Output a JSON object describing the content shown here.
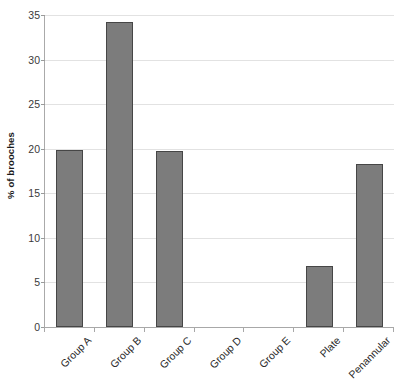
{
  "chart_data": {
    "type": "bar",
    "title": "",
    "subtitle": "",
    "xlabel": "",
    "ylabel": "% of brooches",
    "categories": [
      "Group A",
      "Group B",
      "Group C",
      "Group D",
      "Group E",
      "Plate",
      "Penannular"
    ],
    "values": [
      19.9,
      34.2,
      19.8,
      0,
      0,
      6.9,
      18.3
    ],
    "ylim": [
      0,
      35
    ],
    "ytick_labels": [
      "0",
      "5",
      "10",
      "15",
      "20",
      "25",
      "30",
      "35"
    ],
    "ytick_values": [
      0,
      5,
      10,
      15,
      20,
      25,
      30,
      35
    ],
    "grid": true,
    "grid_axis": "y",
    "legend": false,
    "legend_position": "none",
    "series": [
      {
        "name": "% of brooches",
        "values": [
          19.9,
          34.2,
          19.8,
          0,
          0,
          6.9,
          18.3
        ]
      }
    ],
    "colors": {
      "bar_fill": "#7c7c7c",
      "bar_border": "#464646",
      "gridline": "#e2e2e2",
      "axis": "#a8a8a8",
      "text": "#2b2b2b",
      "background": "#ffffff"
    }
  }
}
